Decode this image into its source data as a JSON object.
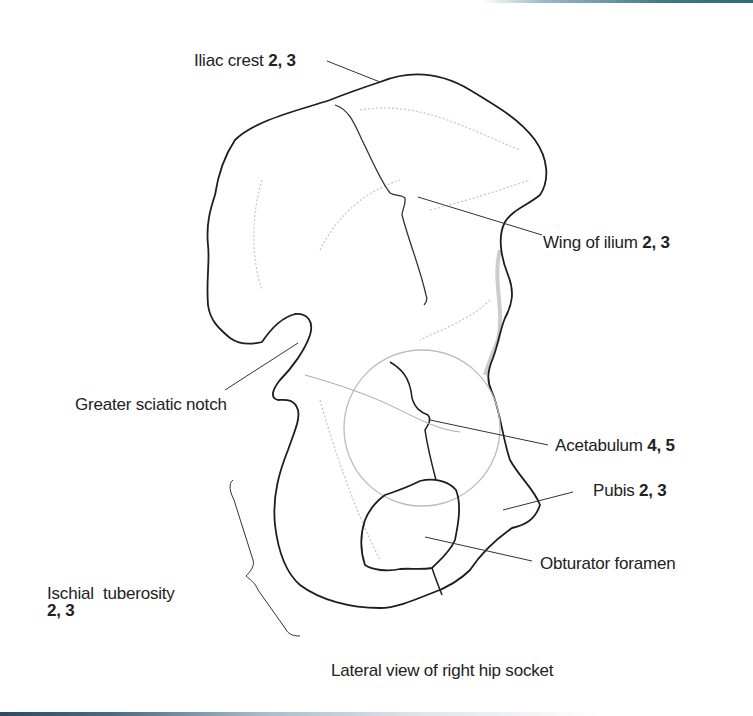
{
  "figure": {
    "title": "Lateral view of right hip socket",
    "colors": {
      "outline": "#1e1e1e",
      "shading": "#b8b8b8",
      "top_bar_accent": "#2f6a7c",
      "bottom_bar_accent": "#2c4a66"
    }
  },
  "labels": [
    {
      "id": "iliac-crest",
      "text": "Iliac crest",
      "refs": "2, 3"
    },
    {
      "id": "wing-of-ilium",
      "text": "Wing of ilium",
      "refs": "2, 3"
    },
    {
      "id": "greater-sciatic-notch",
      "text": "Greater sciatic notch",
      "refs": ""
    },
    {
      "id": "acetabulum",
      "text": "Acetabulum",
      "refs": "4, 5"
    },
    {
      "id": "pubis",
      "text": "Pubis",
      "refs": "2, 3"
    },
    {
      "id": "obturator-foramen",
      "text": "Obturator foramen",
      "refs": ""
    },
    {
      "id": "ischial-tuberosity",
      "text": "Ischial  tuberosity",
      "refs": "2, 3"
    }
  ]
}
